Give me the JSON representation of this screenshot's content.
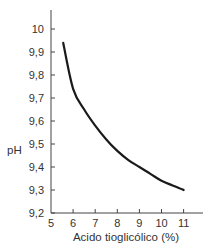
{
  "chart_data": {
    "type": "line",
    "title": "",
    "xlabel": "Acido tioglicólico (%)",
    "ylabel": "pH",
    "xlim": [
      5,
      11.9
    ],
    "ylim": [
      9.2,
      10.18
    ],
    "x_ticks": [
      5,
      6,
      7,
      8,
      9,
      10,
      11
    ],
    "x_tick_labels": [
      "5",
      "6",
      "7",
      "8",
      "9",
      "10",
      "11"
    ],
    "y_ticks": [
      9.2,
      9.3,
      9.4,
      9.5,
      9.6,
      9.7,
      9.8,
      9.9,
      10
    ],
    "y_tick_labels": [
      "9,2",
      "9,3",
      "9,4",
      "9,5",
      "9,6",
      "9,7",
      "9,8",
      "9,9",
      "10"
    ],
    "grid": false,
    "legend": null,
    "series": [
      {
        "name": "pH",
        "color": "#1a1a1a",
        "x": [
          5.55,
          6,
          6.5,
          7,
          7.5,
          8,
          8.5,
          9,
          9.5,
          10,
          10.5,
          11
        ],
        "y": [
          9.94,
          9.74,
          9.65,
          9.58,
          9.52,
          9.47,
          9.43,
          9.4,
          9.37,
          9.34,
          9.32,
          9.3
        ]
      }
    ]
  }
}
